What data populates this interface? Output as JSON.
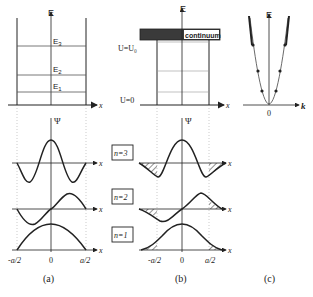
{
  "panels": {
    "a": {
      "caption": "(a)",
      "energy_axis_label": "E",
      "x_axis_label": "x",
      "levels": [
        "E1",
        "E2",
        "E3"
      ],
      "level_labels": {
        "e1": "E",
        "e1_sub": "1",
        "e2": "E",
        "e2_sub": "2",
        "e3": "E",
        "e3_sub": "3"
      },
      "psi_label": "Ψ",
      "tick_labels": {
        "left": "-a/2",
        "center": "0",
        "right": "a/2"
      }
    },
    "b": {
      "caption": "(b)",
      "energy_axis_label": "E",
      "x_axis_label": "x",
      "continuum_label": "continuum",
      "u0_label": "U=U₀",
      "u_zero_label": "U=0",
      "psi_label": "Ψ",
      "tick_labels": {
        "left": "-a/2",
        "center": "0",
        "right": "a/2"
      }
    },
    "c": {
      "caption": "(c)",
      "energy_axis_label": "E",
      "k_axis_label": "k",
      "origin_label": "0"
    }
  },
  "states": [
    {
      "label": "n=3",
      "x_label": "x"
    },
    {
      "label": "n=2",
      "x_label": "x"
    },
    {
      "label": "n=1",
      "x_label": "x"
    }
  ],
  "colors": {
    "ink": "#222222",
    "grid": "#999999",
    "continuum_fill": "#3a3a3a"
  }
}
